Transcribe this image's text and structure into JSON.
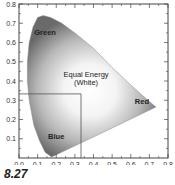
{
  "figure_label": "8.27",
  "chart_data": {
    "type": "area",
    "xlabel": "",
    "ylabel": "",
    "xlim": [
      0.0,
      0.8
    ],
    "ylim": [
      0.0,
      0.8
    ],
    "x_ticks": [
      "0.0",
      "0.1",
      "0.2",
      "0.3",
      "0.4",
      "0.5",
      "0.6",
      "0.7",
      "0.8"
    ],
    "y_ticks": [
      "0.1",
      "0.2",
      "0.3",
      "0.4",
      "0.5",
      "0.6",
      "0.7",
      "0.8"
    ],
    "grid": false,
    "legend": null,
    "annotations": [
      {
        "text": "Green",
        "x": 0.14,
        "y": 0.64
      },
      {
        "text": "Equal Energy",
        "x": 0.36,
        "y": 0.42
      },
      {
        "text": "(White)",
        "x": 0.36,
        "y": 0.38
      },
      {
        "text": "Red",
        "x": 0.66,
        "y": 0.28
      },
      {
        "text": "Blue",
        "x": 0.2,
        "y": 0.1
      }
    ],
    "white_point": {
      "x": 0.333,
      "y": 0.333
    },
    "locus": [
      [
        0.175,
        0.005
      ],
      [
        0.14,
        0.03
      ],
      [
        0.11,
        0.09
      ],
      [
        0.08,
        0.17
      ],
      [
        0.055,
        0.3
      ],
      [
        0.045,
        0.4
      ],
      [
        0.045,
        0.5
      ],
      [
        0.055,
        0.6
      ],
      [
        0.075,
        0.68
      ],
      [
        0.1,
        0.73
      ],
      [
        0.13,
        0.74
      ],
      [
        0.17,
        0.73
      ],
      [
        0.23,
        0.7
      ],
      [
        0.3,
        0.65
      ],
      [
        0.4,
        0.57
      ],
      [
        0.5,
        0.47
      ],
      [
        0.6,
        0.38
      ],
      [
        0.68,
        0.31
      ],
      [
        0.735,
        0.265
      ]
    ]
  }
}
